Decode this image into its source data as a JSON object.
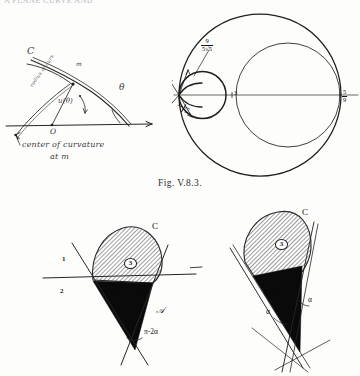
{
  "page": {
    "running_head": "A PLANE CURVE AND",
    "figure_caption": "Fig. V.8.3.",
    "background_color": "#fdfdfc",
    "ink_color": "#161616"
  },
  "figures": [
    {
      "id": "fig-top-left",
      "name": "curvature-diagram",
      "description": "Hand-drawn diagram of a plane curve C with tangent line at point m, support function u(theta), radius of curvature and center of curvature.",
      "labels": [
        {
          "name": "curve-label-c",
          "text": "C"
        },
        {
          "name": "point-m-label",
          "text": "m"
        },
        {
          "name": "radius-of-curvature-label",
          "text": "radius of curv."
        },
        {
          "name": "support-function-label",
          "text": "u(θ)"
        },
        {
          "name": "origin-label",
          "text": "O"
        },
        {
          "name": "angle-theta-label",
          "text": "θ"
        },
        {
          "name": "center-of-curvature-note",
          "line1": "center of curvature",
          "line2": "at m"
        }
      ]
    },
    {
      "id": "fig-top-right",
      "name": "caustic-circles-diagram",
      "description": "Three nested circles through a cusp on the horizontal axis, with marked distances along the axis.",
      "labels": [
        {
          "name": "distance-9-over-5root5",
          "numerator": "9",
          "denominator": "5√5"
        },
        {
          "name": "distance-1-over-root3",
          "numerator": "1",
          "denominator": "√3"
        },
        {
          "name": "axis-mark-3",
          "text": "3"
        },
        {
          "name": "distance-5-over-9",
          "numerator": "5",
          "denominator": "9"
        }
      ]
    },
    {
      "id": "fig-bottom-left",
      "name": "convex-region-with-secant-diagram",
      "description": "Convex curve C with a stippled cap region numbered 3 above a horizontal line, a solid black cone below, bounded by two tangent lines; regions 1 and 2 and angle pi-2alpha marked.",
      "labels": [
        {
          "name": "curve-label-c",
          "text": "C"
        },
        {
          "name": "region-1-label",
          "text": "1"
        },
        {
          "name": "region-2-label",
          "text": "2"
        },
        {
          "name": "region-3-label",
          "text": "3"
        },
        {
          "name": "region-a-label",
          "text": "𝒜"
        },
        {
          "name": "angle-label",
          "text": "π-2α"
        }
      ]
    },
    {
      "id": "fig-bottom-right",
      "name": "convex-region-tilted-diagram",
      "description": "Same convex curve C with stippled region 3 and solid black cone, rotated, with two equal angles alpha marked at the tangent lines.",
      "labels": [
        {
          "name": "curve-label-c",
          "text": "C"
        },
        {
          "name": "region-3-label",
          "text": "3"
        },
        {
          "name": "angle-alpha-left",
          "text": "α"
        },
        {
          "name": "angle-alpha-right",
          "text": "α"
        }
      ]
    }
  ]
}
